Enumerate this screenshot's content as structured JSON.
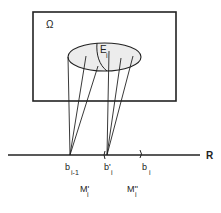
{
  "diagram": {
    "set_label": "Ω",
    "ellipse_label": "E",
    "ellipse_label_sub": "i",
    "axis_label": "R",
    "points": [
      {
        "base": "b",
        "sub": "i-1"
      },
      {
        "base": "b'",
        "sub": "i"
      },
      {
        "base": "b",
        "sub": "i"
      }
    ],
    "measures": [
      {
        "base": "M'",
        "sub": "i"
      },
      {
        "base": "M''",
        "sub": "i"
      }
    ]
  },
  "colors": {
    "stroke": "#222222",
    "ellipse_fill": "#ececec",
    "background": "#ffffff"
  }
}
